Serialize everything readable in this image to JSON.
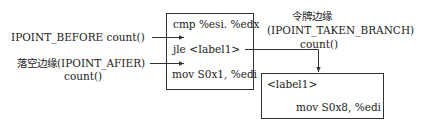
{
  "diagram": {
    "left_labels": {
      "before": "IPOINT_BEFORE  count()",
      "after_line1": "落空边缘(IPOINT_AFIER)",
      "after_line2": "count()"
    },
    "main_block": {
      "lines": [
        "cmp %esi. %edx",
        "jle   <Iabel1>",
        "mov S0x1, %edi"
      ]
    },
    "taken_branch_label": {
      "line1": "令牌边缘",
      "line2": "(IPOINT_TAKEN_BRANCH)",
      "line3": "count()"
    },
    "target_block": {
      "label": "<label1>",
      "instruction": "mov S0x8, %edi"
    },
    "colors": {
      "line": "#333333",
      "text": "#222222",
      "background": "#ffffff"
    }
  }
}
